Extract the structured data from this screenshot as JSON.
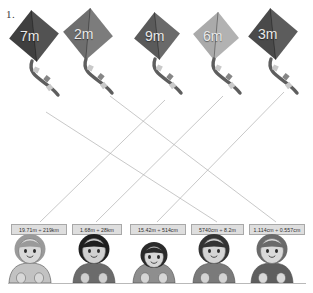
{
  "worksheet": {
    "question_number": "1.",
    "type": "matching-exercise"
  },
  "kites": [
    {
      "label": "7m",
      "fill": "#3f3f3f",
      "x": 8,
      "y": 10,
      "size": 52,
      "label_x": 20,
      "label_y": 28
    },
    {
      "label": "2m",
      "fill": "#6e6e6e",
      "x": 62,
      "y": 8,
      "size": 52,
      "label_x": 74,
      "label_y": 26
    },
    {
      "label": "9m",
      "fill": "#5a5a5a",
      "x": 133,
      "y": 12,
      "size": 48,
      "label_x": 145,
      "label_y": 28
    },
    {
      "label": "6m",
      "fill": "#aaaaaa",
      "x": 192,
      "y": 12,
      "size": 48,
      "label_x": 203,
      "label_y": 28
    },
    {
      "label": "3m",
      "fill": "#4a4a4a",
      "x": 247,
      "y": 8,
      "size": 52,
      "label_x": 258,
      "label_y": 26
    }
  ],
  "answer_cards": [
    {
      "text": "19.71m ÷ 219km",
      "x": 11,
      "y": 224,
      "width": 56
    },
    {
      "text": "1.68m ÷ 28km",
      "x": 72,
      "y": 224,
      "width": 50
    },
    {
      "text": "15.42m ÷ 514cm",
      "x": 130,
      "y": 224,
      "width": 56
    },
    {
      "text": "5740cm ÷ 8.2m",
      "x": 191,
      "y": 224,
      "width": 53
    },
    {
      "text": "1.114cm ÷ 0.557cm",
      "x": 249,
      "y": 224,
      "width": 56
    }
  ],
  "connectors": [
    {
      "from_x": 46,
      "from_y": 112,
      "to_x": 217,
      "to_y": 222
    },
    {
      "from_x": 110,
      "from_y": 96,
      "to_x": 276,
      "to_y": 222
    },
    {
      "from_x": 165,
      "from_y": 100,
      "to_x": 40,
      "to_y": 222
    },
    {
      "from_x": 223,
      "from_y": 96,
      "to_x": 96,
      "to_y": 222
    },
    {
      "from_x": 284,
      "from_y": 92,
      "to_x": 157,
      "to_y": 222
    }
  ],
  "children": [
    {
      "name": "child-1",
      "x": 30,
      "hair": "#9a9a9a",
      "skin": "#d8d8d8",
      "shirt": "#c2c2c2"
    },
    {
      "name": "child-2",
      "x": 94,
      "hair": "#1f1f1f",
      "skin": "#d0d0d0",
      "shirt": "#6b6b6b"
    },
    {
      "name": "child-3",
      "x": 154,
      "hair": "#2a2a2a",
      "skin": "#d6d6d6",
      "shirt": "#8e8e8e"
    },
    {
      "name": "child-4",
      "x": 214,
      "hair": "#333333",
      "skin": "#d4d4d4",
      "shirt": "#7a7a7a"
    },
    {
      "name": "child-5",
      "x": 272,
      "hair": "#6a6a6a",
      "skin": "#d9d9d9",
      "shirt": "#5e5e5e"
    }
  ],
  "colors": {
    "card_bg": "#dedede",
    "card_border": "#a8a8a8",
    "line": "#b0b0b0",
    "ground": "#b9b9b9",
    "text": "#2e2e2e"
  }
}
